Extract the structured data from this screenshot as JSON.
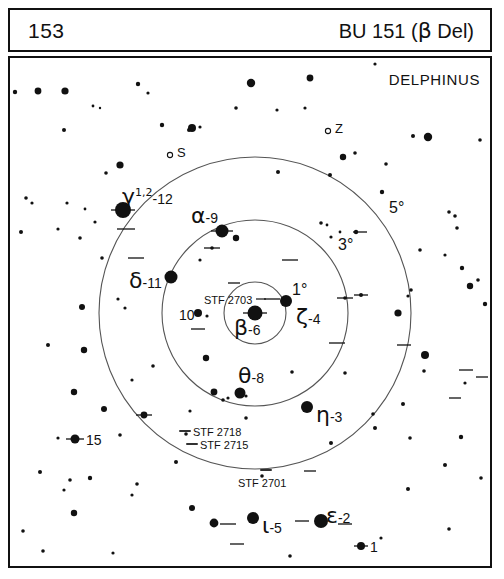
{
  "header": {
    "page_number": "153",
    "title_prefix": "BU 151 (",
    "title_greek": "β",
    "title_suffix": " Del)"
  },
  "map": {
    "constellation": "DELPHINUS",
    "frame_color": "#111111",
    "background_color": "#ffffff",
    "star_color": "#111111",
    "circle_color": "#555555"
  },
  "rings": [
    {
      "name": "one-degree",
      "label": "1°",
      "radius_px": 31,
      "label_x": 292,
      "label_y": 282
    },
    {
      "name": "three-degree",
      "label": "3°",
      "radius_px": 93,
      "label_x": 338,
      "label_y": 237
    },
    {
      "name": "five-degree",
      "label": "5°",
      "radius_px": 156,
      "label_x": 389,
      "label_y": 200
    }
  ],
  "ring_center": {
    "x": 255,
    "y": 313
  },
  "named_stars": [
    {
      "id": "beta",
      "greek": "β",
      "sup": "",
      "flamsteed": "-6",
      "x": 255,
      "y": 313,
      "r": 7.5,
      "label_x": 234,
      "label_y": 317,
      "double": true
    },
    {
      "id": "gamma",
      "greek": "γ",
      "sup": "1,2",
      "flamsteed": "-12",
      "x": 123,
      "y": 210,
      "r": 8.0,
      "label_x": 122,
      "label_y": 186,
      "double": true
    },
    {
      "id": "alpha",
      "greek": "α",
      "sup": "",
      "flamsteed": "-9",
      "x": 222,
      "y": 231,
      "r": 6.5,
      "label_x": 191,
      "label_y": 205,
      "double": true
    },
    {
      "id": "delta",
      "greek": "δ",
      "sup": "",
      "flamsteed": "-11",
      "x": 171,
      "y": 277,
      "r": 6.5,
      "label_x": 129,
      "label_y": 270,
      "double": false
    },
    {
      "id": "zeta",
      "greek": "ζ",
      "sup": "",
      "flamsteed": "-4",
      "x": 286,
      "y": 301,
      "r": 6.0,
      "label_x": 296,
      "label_y": 306,
      "double": false
    },
    {
      "id": "theta",
      "greek": "θ",
      "sup": "",
      "flamsteed": "-8",
      "x": 240,
      "y": 393,
      "r": 5.5,
      "label_x": 238,
      "label_y": 365,
      "double": false
    },
    {
      "id": "eta",
      "greek": "η",
      "sup": "",
      "flamsteed": "-3",
      "x": 307,
      "y": 407,
      "r": 6.0,
      "label_x": 316,
      "label_y": 404,
      "double": false
    },
    {
      "id": "iota",
      "greek": "ι",
      "sup": "",
      "flamsteed": "-5",
      "x": 253,
      "y": 518,
      "r": 6.0,
      "label_x": 262,
      "label_y": 515,
      "double": false
    },
    {
      "id": "epsilon",
      "greek": "ε",
      "sup": "",
      "flamsteed": "-2",
      "x": 321,
      "y": 521,
      "r": 7.0,
      "label_x": 326,
      "label_y": 505,
      "double": true
    }
  ],
  "numbered_stars": [
    {
      "label": "10",
      "x": 198,
      "y": 313,
      "r": 4.0,
      "label_x": 179,
      "label_y": 308
    },
    {
      "label": "15",
      "x": 75,
      "y": 439,
      "r": 4.5,
      "label_x": 86,
      "label_y": 433
    },
    {
      "label": "1",
      "x": 361,
      "y": 546,
      "r": 4.0,
      "label_x": 370,
      "label_y": 540
    }
  ],
  "stf_labels": [
    {
      "label": "STF 2703",
      "x": 204,
      "y": 295,
      "tick_x": 261,
      "tick_y": 299
    },
    {
      "label": "STF 2718",
      "x": 193,
      "y": 427,
      "tick_x": 185,
      "tick_y": 431
    },
    {
      "label": "STF 2715",
      "x": 200,
      "y": 440,
      "tick_x": 192,
      "tick_y": 444
    },
    {
      "label": "STF 2701",
      "x": 238,
      "y": 478,
      "tick_x": 266,
      "tick_y": 470
    }
  ],
  "variable_markers": [
    {
      "label": "S",
      "x": 174,
      "y": 155,
      "circle_x": 170,
      "circle_y": 155
    },
    {
      "label": "Z",
      "x": 332,
      "y": 131,
      "circle_x": 328,
      "circle_y": 131
    }
  ],
  "field_stars": [
    {
      "x": 15,
      "y": 92,
      "r": 2.2
    },
    {
      "x": 38,
      "y": 91,
      "r": 3.4
    },
    {
      "x": 65,
      "y": 91,
      "r": 3.6
    },
    {
      "x": 138,
      "y": 84,
      "r": 2.2
    },
    {
      "x": 148,
      "y": 93,
      "r": 1.6
    },
    {
      "x": 93,
      "y": 106,
      "r": 1.4
    },
    {
      "x": 100,
      "y": 108,
      "r": 1.2
    },
    {
      "x": 64,
      "y": 130,
      "r": 2.0
    },
    {
      "x": 162,
      "y": 125,
      "r": 2.2
    },
    {
      "x": 192,
      "y": 128,
      "r": 4.0
    },
    {
      "x": 120,
      "y": 165,
      "r": 3.6
    },
    {
      "x": 106,
      "y": 173,
      "r": 1.8
    },
    {
      "x": 26,
      "y": 198,
      "r": 1.8
    },
    {
      "x": 67,
      "y": 203,
      "r": 1.6
    },
    {
      "x": 85,
      "y": 209,
      "r": 1.4
    },
    {
      "x": 251,
      "y": 83,
      "r": 4.2
    },
    {
      "x": 236,
      "y": 108,
      "r": 1.8
    },
    {
      "x": 277,
      "y": 110,
      "r": 1.6
    },
    {
      "x": 305,
      "y": 108,
      "r": 1.6
    },
    {
      "x": 189,
      "y": 130,
      "r": 2.0
    },
    {
      "x": 200,
      "y": 127,
      "r": 1.6
    },
    {
      "x": 310,
      "y": 78,
      "r": 3.4
    },
    {
      "x": 375,
      "y": 64,
      "r": 1.6
    },
    {
      "x": 428,
      "y": 137,
      "r": 4.2
    },
    {
      "x": 343,
      "y": 157,
      "r": 3.2
    },
    {
      "x": 355,
      "y": 153,
      "r": 1.8
    },
    {
      "x": 386,
      "y": 164,
      "r": 1.8
    },
    {
      "x": 413,
      "y": 136,
      "r": 2.0
    },
    {
      "x": 480,
      "y": 140,
      "r": 1.8
    },
    {
      "x": 330,
      "y": 175,
      "r": 2.0
    },
    {
      "x": 278,
      "y": 172,
      "r": 2.0
    },
    {
      "x": 382,
      "y": 192,
      "r": 2.2
    },
    {
      "x": 449,
      "y": 212,
      "r": 1.8
    },
    {
      "x": 455,
      "y": 216,
      "r": 1.8
    },
    {
      "x": 32,
      "y": 203,
      "r": 1.6
    },
    {
      "x": 95,
      "y": 222,
      "r": 1.6
    },
    {
      "x": 21,
      "y": 232,
      "r": 2.0
    },
    {
      "x": 58,
      "y": 229,
      "r": 1.6
    },
    {
      "x": 80,
      "y": 238,
      "r": 1.8
    },
    {
      "x": 102,
      "y": 258,
      "r": 1.8
    },
    {
      "x": 331,
      "y": 237,
      "r": 1.6
    },
    {
      "x": 340,
      "y": 232,
      "r": 1.4
    },
    {
      "x": 356,
      "y": 232,
      "r": 2.2
    },
    {
      "x": 321,
      "y": 223,
      "r": 1.8
    },
    {
      "x": 327,
      "y": 225,
      "r": 1.4
    },
    {
      "x": 236,
      "y": 238,
      "r": 3.2
    },
    {
      "x": 212,
      "y": 248,
      "r": 1.8
    },
    {
      "x": 200,
      "y": 260,
      "r": 1.6
    },
    {
      "x": 420,
      "y": 250,
      "r": 1.8
    },
    {
      "x": 445,
      "y": 255,
      "r": 1.6
    },
    {
      "x": 457,
      "y": 228,
      "r": 1.8
    },
    {
      "x": 462,
      "y": 268,
      "r": 2.2
    },
    {
      "x": 478,
      "y": 280,
      "r": 1.8
    },
    {
      "x": 411,
      "y": 290,
      "r": 1.8
    },
    {
      "x": 125,
      "y": 308,
      "r": 1.6
    },
    {
      "x": 82,
      "y": 307,
      "r": 3.0
    },
    {
      "x": 118,
      "y": 299,
      "r": 1.6
    },
    {
      "x": 207,
      "y": 316,
      "r": 1.6
    },
    {
      "x": 289,
      "y": 302,
      "r": 2.2
    },
    {
      "x": 345,
      "y": 298,
      "r": 1.8
    },
    {
      "x": 361,
      "y": 295,
      "r": 2.0
    },
    {
      "x": 398,
      "y": 313,
      "r": 3.6
    },
    {
      "x": 408,
      "y": 296,
      "r": 1.6
    },
    {
      "x": 470,
      "y": 286,
      "r": 3.2
    },
    {
      "x": 485,
      "y": 304,
      "r": 2.2
    },
    {
      "x": 425,
      "y": 355,
      "r": 4.0
    },
    {
      "x": 48,
      "y": 345,
      "r": 2.0
    },
    {
      "x": 84,
      "y": 350,
      "r": 3.2
    },
    {
      "x": 206,
      "y": 358,
      "r": 3.2
    },
    {
      "x": 153,
      "y": 366,
      "r": 1.8
    },
    {
      "x": 214,
      "y": 392,
      "r": 3.4
    },
    {
      "x": 223,
      "y": 400,
      "r": 1.8
    },
    {
      "x": 228,
      "y": 398,
      "r": 1.6
    },
    {
      "x": 246,
      "y": 396,
      "r": 1.6
    },
    {
      "x": 292,
      "y": 372,
      "r": 1.8
    },
    {
      "x": 246,
      "y": 418,
      "r": 1.8
    },
    {
      "x": 345,
      "y": 373,
      "r": 1.8
    },
    {
      "x": 190,
      "y": 411,
      "r": 1.6
    },
    {
      "x": 132,
      "y": 380,
      "r": 1.6
    },
    {
      "x": 74,
      "y": 392,
      "r": 3.2
    },
    {
      "x": 104,
      "y": 409,
      "r": 3.0
    },
    {
      "x": 186,
      "y": 434,
      "r": 1.8
    },
    {
      "x": 58,
      "y": 438,
      "r": 1.6
    },
    {
      "x": 120,
      "y": 435,
      "r": 1.8
    },
    {
      "x": 144,
      "y": 415,
      "r": 3.4
    },
    {
      "x": 373,
      "y": 414,
      "r": 1.8
    },
    {
      "x": 403,
      "y": 404,
      "r": 2.0
    },
    {
      "x": 331,
      "y": 443,
      "r": 2.0
    },
    {
      "x": 375,
      "y": 428,
      "r": 2.0
    },
    {
      "x": 410,
      "y": 438,
      "r": 1.8
    },
    {
      "x": 461,
      "y": 437,
      "r": 2.2
    },
    {
      "x": 465,
      "y": 383,
      "r": 1.6
    },
    {
      "x": 424,
      "y": 371,
      "r": 1.8
    },
    {
      "x": 40,
      "y": 472,
      "r": 2.0
    },
    {
      "x": 70,
      "y": 480,
      "r": 1.8
    },
    {
      "x": 90,
      "y": 478,
      "r": 2.2
    },
    {
      "x": 137,
      "y": 484,
      "r": 1.8
    },
    {
      "x": 132,
      "y": 495,
      "r": 1.6
    },
    {
      "x": 192,
      "y": 508,
      "r": 3.0
    },
    {
      "x": 74,
      "y": 513,
      "r": 3.2
    },
    {
      "x": 214,
      "y": 523,
      "r": 4.4
    },
    {
      "x": 64,
      "y": 490,
      "r": 1.6
    },
    {
      "x": 23,
      "y": 531,
      "r": 1.8
    },
    {
      "x": 43,
      "y": 551,
      "r": 1.8
    },
    {
      "x": 113,
      "y": 553,
      "r": 1.6
    },
    {
      "x": 290,
      "y": 556,
      "r": 1.8
    },
    {
      "x": 381,
      "y": 538,
      "r": 1.6
    },
    {
      "x": 449,
      "y": 529,
      "r": 1.8
    },
    {
      "x": 408,
      "y": 489,
      "r": 2.0
    },
    {
      "x": 481,
      "y": 478,
      "r": 1.8
    },
    {
      "x": 445,
      "y": 465,
      "r": 2.0
    },
    {
      "x": 262,
      "y": 476,
      "r": 1.8
    },
    {
      "x": 176,
      "y": 462,
      "r": 2.0
    }
  ],
  "double_ticks": [
    {
      "x": 123,
      "y": 210,
      "w": 24
    },
    {
      "x": 126,
      "y": 229,
      "w": 18
    },
    {
      "x": 222,
      "y": 231,
      "w": 22
    },
    {
      "x": 212,
      "y": 248,
      "w": 16
    },
    {
      "x": 255,
      "y": 313,
      "w": 24
    },
    {
      "x": 272,
      "y": 299,
      "w": 16
    },
    {
      "x": 136,
      "y": 258,
      "w": 16
    },
    {
      "x": 198,
      "y": 329,
      "w": 14
    },
    {
      "x": 290,
      "y": 260,
      "w": 16
    },
    {
      "x": 345,
      "y": 298,
      "w": 16
    },
    {
      "x": 337,
      "y": 343,
      "w": 16
    },
    {
      "x": 361,
      "y": 295,
      "w": 14
    },
    {
      "x": 360,
      "y": 232,
      "w": 14
    },
    {
      "x": 404,
      "y": 345,
      "w": 14
    },
    {
      "x": 75,
      "y": 439,
      "w": 18
    },
    {
      "x": 144,
      "y": 415,
      "w": 16
    },
    {
      "x": 185,
      "y": 431,
      "w": 12
    },
    {
      "x": 192,
      "y": 444,
      "w": 12
    },
    {
      "x": 266,
      "y": 470,
      "w": 12
    },
    {
      "x": 310,
      "y": 471,
      "w": 12
    },
    {
      "x": 228,
      "y": 524,
      "w": 16
    },
    {
      "x": 302,
      "y": 521,
      "w": 14
    },
    {
      "x": 345,
      "y": 524,
      "w": 14
    },
    {
      "x": 361,
      "y": 546,
      "w": 14
    },
    {
      "x": 237,
      "y": 544,
      "w": 14
    },
    {
      "x": 466,
      "y": 370,
      "w": 14
    },
    {
      "x": 455,
      "y": 398,
      "w": 12
    },
    {
      "x": 482,
      "y": 377,
      "w": 12
    },
    {
      "x": 234,
      "y": 283,
      "w": 12
    }
  ]
}
